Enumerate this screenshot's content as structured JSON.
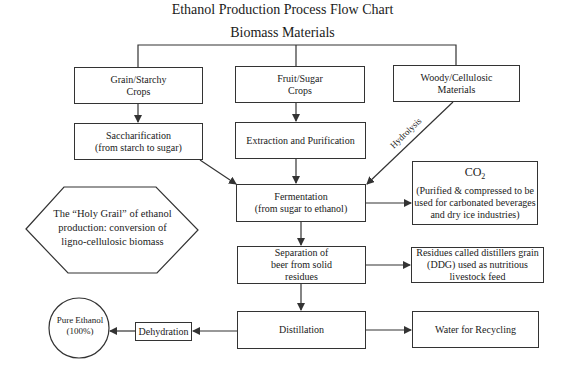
{
  "title": "Ethanol Production Process Flow Chart",
  "root": "Biomass Materials",
  "feedstocks": [
    {
      "line1": "Grain/Starchy",
      "line2": "Crops"
    },
    {
      "line1": "Fruit/Sugar",
      "line2": "Crops"
    },
    {
      "line1": "Woody/Cellulosic",
      "line2": "Materials"
    }
  ],
  "pretreatment": [
    {
      "line1": "Saccharification",
      "line2": "(from starch to sugar)"
    },
    {
      "line1": "Extraction and Purification"
    }
  ],
  "hydrolysis_label": "Hydrolysis",
  "fermentation": {
    "line1": "Fermentation",
    "line2": "(from sugar to ethanol)"
  },
  "co2": {
    "head": "CO",
    "sub": "2",
    "line1": "(Purified & compressed to be",
    "line2": "used for carbonated beverages",
    "line3": "and dry ice industries)"
  },
  "holy_grail": {
    "line1": "The “Holy Grail” of ethanol",
    "line2": "production: conversion of",
    "line3": "ligno-cellulosic biomass"
  },
  "separation": {
    "line1": "Separation of",
    "line2": "beer from solid",
    "line3": "residues"
  },
  "ddg": {
    "line1": "Residues called distillers grain",
    "line2": "(DDG) used as nutritious",
    "line3": "livestock feed"
  },
  "distillation": "Distillation",
  "water": "Water for Recycling",
  "dehydration": "Dehydration",
  "pure_ethanol": {
    "line1": "Pure Ethanol",
    "line2": "(100%)"
  },
  "colors": {
    "line": "#333333",
    "background": "#ffffff",
    "text": "#1a1a1a"
  }
}
